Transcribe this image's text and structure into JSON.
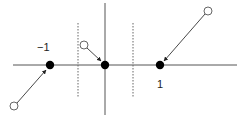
{
  "diagram": {
    "labels": {
      "neg_one": "−1",
      "pos_one": "1"
    },
    "colors": {
      "axis": "#555555",
      "dotted": "#666666",
      "arrow": "#333333",
      "filled_point": "#000000",
      "open_point_stroke": "#555555"
    },
    "fixed_points": [
      {
        "name": "neg-one",
        "x": -1
      },
      {
        "name": "origin",
        "x": 0
      },
      {
        "name": "pos-one",
        "x": 1
      }
    ],
    "flows": [
      {
        "from": "open-point-lower-left",
        "to": "neg-one"
      },
      {
        "from": "open-point-upper-left",
        "to": "origin"
      },
      {
        "from": "open-point-upper-right",
        "to": "pos-one"
      }
    ]
  }
}
